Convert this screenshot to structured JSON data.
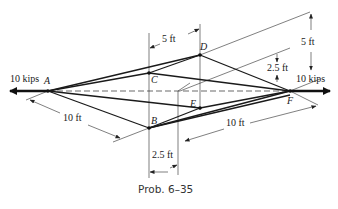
{
  "figure": {
    "caption": "Prob. 6–35",
    "loads": {
      "left": "10 kips",
      "right": "10 kips"
    },
    "joints": {
      "A": "A",
      "B": "B",
      "C": "C",
      "D": "D",
      "E": "E",
      "F": "F"
    },
    "dimensions": {
      "top_width": "5 ft",
      "right_height": "5 ft",
      "right_offset": "2.5 ft",
      "left_length": "10 ft",
      "right_length": "10 ft",
      "bottom_offset": "2.5 ft"
    },
    "colors": {
      "line": "#1a1a1a",
      "background": "#ffffff"
    }
  }
}
